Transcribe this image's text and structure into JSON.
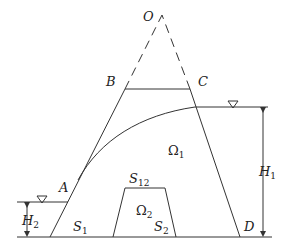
{
  "diagram": {
    "title": "",
    "labels": {
      "O": "O",
      "B": "B",
      "C": "C",
      "A": "A",
      "D": "D",
      "omega1_main": "Ω",
      "omega1_sub": "1",
      "omega2_main": "Ω",
      "omega2_sub": "2",
      "S12_main": "S",
      "S12_sub": "12",
      "S1_main": "S",
      "S1_sub": "1",
      "S2_main": "S",
      "S2_sub": "2",
      "H1_main": "H",
      "H1_sub": "1",
      "H2_main": "H",
      "H2_sub": "2"
    },
    "elements": [
      "dam-trapezoid-ABCD",
      "dashed-extension-to-apex-O",
      "seepage-free-surface-curve",
      "upstream-water-level-H1",
      "downstream-water-level-H2",
      "inner-trapezoid-omega2",
      "base-line"
    ],
    "colors": {
      "stroke": "#333333",
      "text": "#222222",
      "background": "#ffffff"
    }
  }
}
